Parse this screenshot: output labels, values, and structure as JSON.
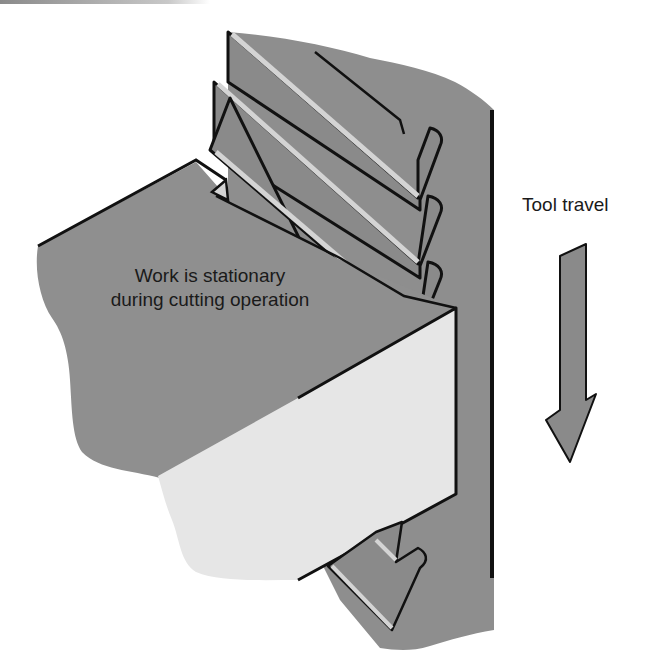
{
  "diagram": {
    "type": "broaching-operation-illustration",
    "labels": {
      "work_line1": "Work is stationary",
      "work_line2": "during cutting operation",
      "tool_travel": "Tool travel"
    },
    "colors": {
      "background": "#ffffff",
      "tool_body": "#8e8e8e",
      "tooth_face": "#8a8a8a",
      "tooth_edge_highlight": "#d4d4d4",
      "work_top": "#8f8f8f",
      "work_front": "#e6e6e6",
      "outline": "#111111",
      "arrow_fill": "#8a8a8a",
      "text": "#1a1a1a"
    },
    "elements": [
      "broach-tool",
      "broach-teeth",
      "workpiece",
      "tool-travel-arrow"
    ]
  }
}
